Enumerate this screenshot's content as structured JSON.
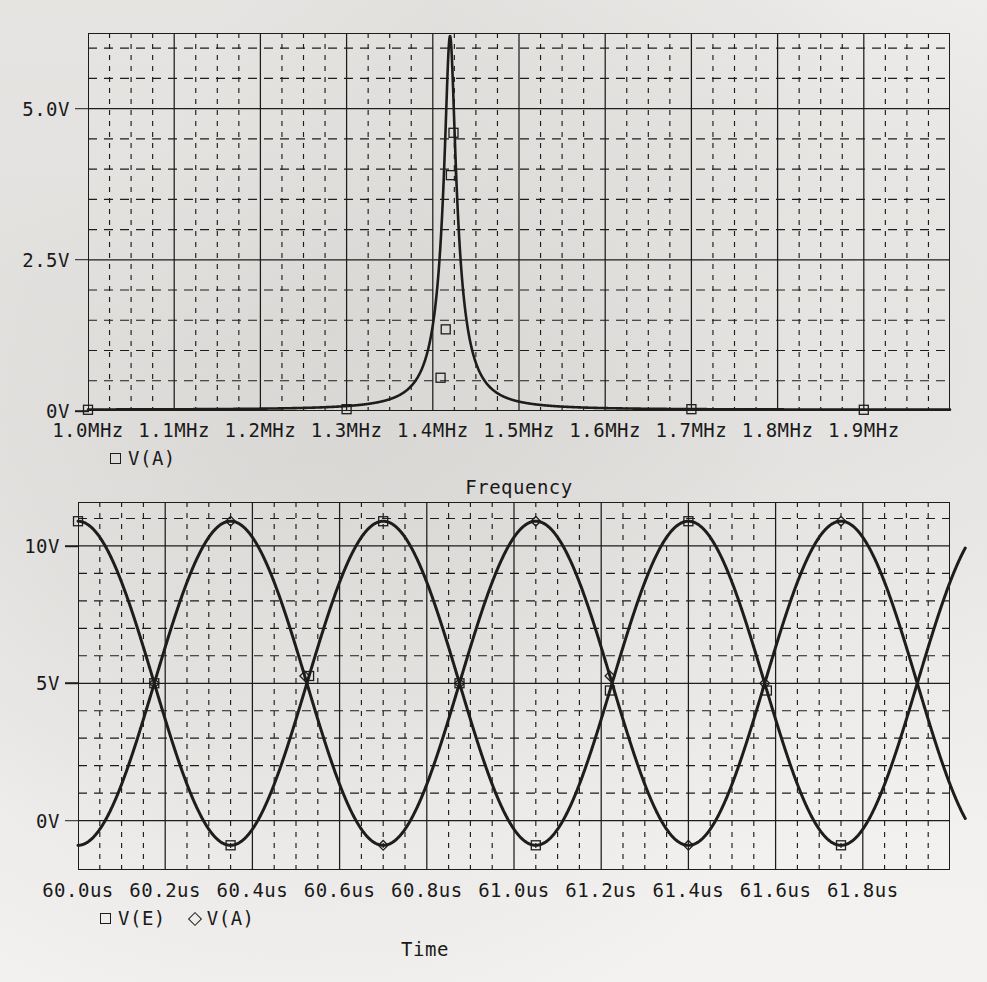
{
  "app": {
    "kind": "spice-probe-plot",
    "background_color": "#f2f1ef",
    "ink_color": "#1d1d1d"
  },
  "chart_data": [
    {
      "id": "ac-sweep",
      "type": "line",
      "title": "",
      "xlabel": "Frequency",
      "ylabel": "",
      "legend": [
        {
          "label": "V(A)",
          "marker": "square"
        }
      ],
      "legend_position": "below-axis-left",
      "grid": true,
      "xlim": [
        1.0,
        2.0
      ],
      "ylim": [
        0,
        6.25
      ],
      "xunit": "MHz",
      "yunit": "V",
      "xticks": [
        "1.0MHz",
        "1.1MHz",
        "1.2MHz",
        "1.3MHz",
        "1.4MHz",
        "1.5MHz",
        "1.6MHz",
        "1.7MHz",
        "1.8MHz",
        "1.9MHz"
      ],
      "xtick_values": [
        1.0,
        1.1,
        1.2,
        1.3,
        1.4,
        1.5,
        1.6,
        1.7,
        1.8,
        1.9
      ],
      "xminor_per_major": 4,
      "yticks": [
        "0V",
        "2.5V",
        "5.0V"
      ],
      "ytick_values": [
        0,
        2.5,
        5.0
      ],
      "yminor_per_major": 5,
      "series": [
        {
          "name": "V(A)",
          "description": "Sharp series-resonance peak near 1.42 MHz",
          "resonance_freq_mhz": 1.42,
          "peak_value": 6.2,
          "baseline_value": 0.02,
          "q_bandwidth_mhz": 0.012,
          "marker_points": [
            {
              "x": 1.0,
              "y": 0.02
            },
            {
              "x": 1.3,
              "y": 0.03
            },
            {
              "x": 1.409,
              "y": 0.55
            },
            {
              "x": 1.415,
              "y": 1.35
            },
            {
              "x": 1.421,
              "y": 3.9
            },
            {
              "x": 1.424,
              "y": 4.6
            },
            {
              "x": 1.7,
              "y": 0.03
            },
            {
              "x": 1.9,
              "y": 0.02
            }
          ]
        }
      ]
    },
    {
      "id": "transient",
      "type": "line",
      "title": "",
      "xlabel": "Time",
      "ylabel": "",
      "legend": [
        {
          "label": "V(E)",
          "marker": "square"
        },
        {
          "label": "V(A)",
          "marker": "diamond"
        }
      ],
      "legend_position": "below-axis-left",
      "grid": true,
      "xlim": [
        60.0,
        62.0
      ],
      "ylim": [
        -1.8,
        11.6
      ],
      "xunit": "us",
      "yunit": "V",
      "xticks": [
        "60.0us",
        "60.2us",
        "60.4us",
        "60.6us",
        "60.8us",
        "61.0us",
        "61.2us",
        "61.4us",
        "61.6us",
        "61.8us"
      ],
      "xtick_values": [
        60.0,
        60.2,
        60.4,
        60.6,
        60.8,
        61.0,
        61.2,
        61.4,
        61.6,
        61.8
      ],
      "xminor_per_major": 4,
      "yticks": [
        "0V",
        "5V",
        "10V"
      ],
      "ytick_values": [
        0,
        5,
        10
      ],
      "yminor_per_major": 5,
      "series": [
        {
          "name": "V(E)",
          "description": "Sinusoid, offset 5V, amplitude 5.9V, period 0.70us, starting near maximum",
          "offset": 5.0,
          "amplitude": 5.9,
          "period_us": 0.7,
          "phase_deg": 0,
          "min_value": -0.9,
          "max_value": 10.9
        },
        {
          "name": "V(A)",
          "description": "Sinusoid 180 degrees out of phase with V(E)",
          "offset": 5.0,
          "amplitude": 5.9,
          "period_us": 0.7,
          "phase_deg": 180,
          "min_value": -0.9,
          "max_value": 10.9
        }
      ]
    }
  ]
}
